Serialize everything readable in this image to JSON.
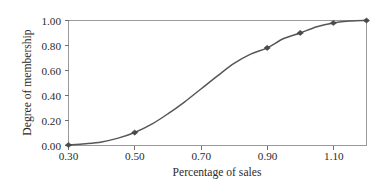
{
  "chart_data": {
    "type": "line",
    "title": "",
    "subtitle": "",
    "xlabel": "Percentage of sales",
    "ylabel": "Degree of membership",
    "xlim": [
      0.3,
      1.2
    ],
    "ylim": [
      0.0,
      1.0
    ],
    "grid": false,
    "legend": null,
    "legend_position": "none",
    "marker": "diamond",
    "line_color": "#575757",
    "marker_color": "#4a4a4a",
    "xticks": [
      "0.30",
      "0.50",
      "0.70",
      "0.90",
      "1.10"
    ],
    "xtick_values": [
      0.3,
      0.5,
      0.7,
      0.9,
      1.1
    ],
    "yticks": [
      "0.00",
      "0.20",
      "0.40",
      "0.60",
      "0.80",
      "1.00"
    ],
    "ytick_values": [
      0.0,
      0.2,
      0.4,
      0.6,
      0.8,
      1.0
    ],
    "series": [
      {
        "name": "Degree of membership",
        "x": [
          0.3,
          0.5,
          0.9,
          1.0,
          1.1,
          1.2
        ],
        "values": [
          0.0,
          0.1,
          0.78,
          0.9,
          0.98,
          1.0
        ]
      }
    ],
    "curve_points": {
      "x": [
        0.3,
        0.35,
        0.4,
        0.45,
        0.5,
        0.55,
        0.6,
        0.65,
        0.7,
        0.75,
        0.8,
        0.85,
        0.9,
        0.95,
        1.0,
        1.05,
        1.1,
        1.15,
        1.2
      ],
      "y": [
        0.0,
        0.01,
        0.025,
        0.055,
        0.1,
        0.165,
        0.25,
        0.345,
        0.45,
        0.555,
        0.655,
        0.73,
        0.78,
        0.855,
        0.9,
        0.95,
        0.98,
        0.995,
        1.0
      ]
    }
  },
  "axes": {
    "x_title": "Percentage of sales",
    "y_title": "Degree of membership"
  }
}
